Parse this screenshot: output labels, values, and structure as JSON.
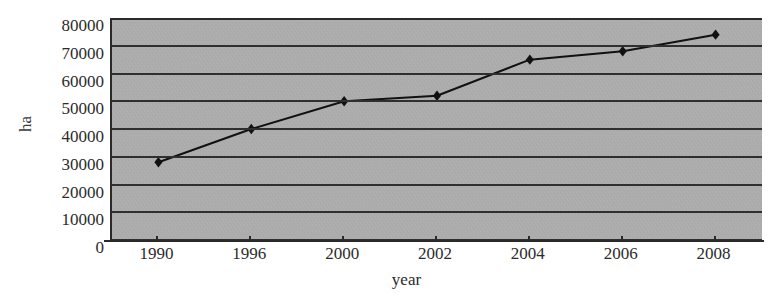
{
  "figure": {
    "title_fragment": "",
    "background_color": "#ffffff",
    "plot_background_color": "#b2b2b2",
    "gridline_color": "#2f2f2f",
    "series_color": "#111111"
  },
  "chart_data": {
    "type": "line",
    "title": "",
    "xlabel": "year",
    "ylabel": "ha",
    "categories": [
      "1990",
      "1996",
      "2000",
      "2002",
      "2004",
      "2006",
      "2008"
    ],
    "x": [
      1990,
      1996,
      2000,
      2002,
      2004,
      2006,
      2008
    ],
    "values": [
      28000,
      40000,
      50000,
      52000,
      65000,
      68000,
      74000
    ],
    "series": [
      {
        "name": "area",
        "values": [
          28000,
          40000,
          50000,
          52000,
          65000,
          68000,
          74000
        ]
      }
    ],
    "ylim": [
      0,
      80000
    ],
    "ytick_labels": [
      "80000",
      "70000",
      "60000",
      "50000",
      "40000",
      "30000",
      "20000",
      "10000",
      "0"
    ],
    "yticks": [
      80000,
      70000,
      60000,
      50000,
      40000,
      30000,
      20000,
      10000,
      0
    ],
    "grid": true,
    "grid_axis": "y",
    "legend": false,
    "legend_position": "none",
    "marker": "diamond",
    "line_width": 2,
    "x_spacing": "categorical"
  }
}
